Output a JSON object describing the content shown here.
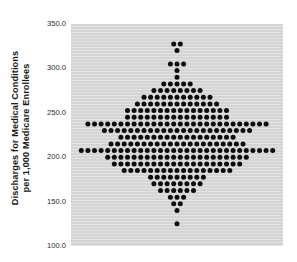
{
  "figure": {
    "y_axis_title_line1": "Discharges for Medical Conditions",
    "y_axis_title_line2": "per 1,000 Medicare Enrollees"
  },
  "chart_data": {
    "type": "scatter",
    "subtype": "dot-density-distribution",
    "title": "",
    "xlabel": "",
    "ylabel": "Discharges for Medical Conditions per 1,000 Medicare Enrollees",
    "ylim": [
      100,
      350
    ],
    "yticks": [
      {
        "value": 350,
        "label": "350.0"
      },
      {
        "value": 300,
        "label": "300.0"
      },
      {
        "value": 250,
        "label": "250.0"
      },
      {
        "value": 200,
        "label": "200.0"
      },
      {
        "value": 150,
        "label": "150.0"
      },
      {
        "value": 100,
        "label": "100.0"
      }
    ],
    "grid": false,
    "legend": false,
    "bin_width": 7.5,
    "rows": [
      {
        "value": 327.5,
        "count": 2
      },
      {
        "value": 320.0,
        "count": 1
      },
      {
        "value": 312.5,
        "count": 0
      },
      {
        "value": 305.0,
        "count": 3
      },
      {
        "value": 297.5,
        "count": 1
      },
      {
        "value": 290.0,
        "count": 1
      },
      {
        "value": 282.5,
        "count": 5
      },
      {
        "value": 275.0,
        "count": 8
      },
      {
        "value": 267.5,
        "count": 11
      },
      {
        "value": 260.0,
        "count": 13
      },
      {
        "value": 252.5,
        "count": 16
      },
      {
        "value": 245.0,
        "count": 16
      },
      {
        "value": 237.5,
        "count": 28
      },
      {
        "value": 230.0,
        "count": 23
      },
      {
        "value": 222.5,
        "count": 18
      },
      {
        "value": 215.0,
        "count": 21
      },
      {
        "value": 207.5,
        "count": 30
      },
      {
        "value": 200.0,
        "count": 22
      },
      {
        "value": 192.5,
        "count": 20
      },
      {
        "value": 185.0,
        "count": 17
      },
      {
        "value": 177.5,
        "count": 9
      },
      {
        "value": 170.0,
        "count": 8
      },
      {
        "value": 162.5,
        "count": 6
      },
      {
        "value": 155.0,
        "count": 3
      },
      {
        "value": 147.5,
        "count": 2
      },
      {
        "value": 140.0,
        "count": 1
      },
      {
        "value": 132.5,
        "count": 0
      },
      {
        "value": 125.0,
        "count": 1
      }
    ],
    "colors": {
      "page_bg": "#ffffff",
      "plot_bg": "#d8d8d8",
      "dot": "#0d0d0d",
      "text": "#1a1a1a"
    }
  }
}
